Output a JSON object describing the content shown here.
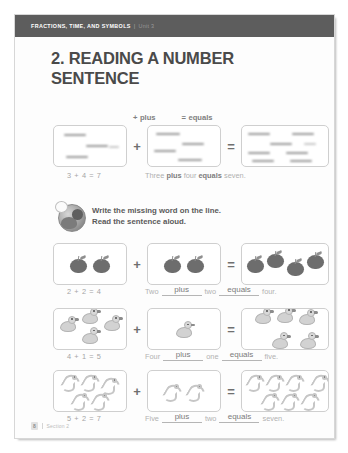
{
  "header": {
    "title": "FRACTIONS, TIME, AND SYMBOLS",
    "separator": "|",
    "unit": "Unit 3"
  },
  "lesson": {
    "title": "2. READING A NUMBER SENTENCE"
  },
  "symbol_key": [
    {
      "symbol": "+",
      "word": "plus"
    },
    {
      "symbol": "=",
      "word": "equals"
    }
  ],
  "example": {
    "operator_plus": "+",
    "operator_equals": "=",
    "equation": "3 + 4 = 7",
    "sentence_parts": {
      "first": "Three",
      "plus": "plus",
      "second": "four",
      "equals": "equals",
      "result": "seven."
    }
  },
  "instruction": {
    "icon": "teacher-badge-icon",
    "line1": "Write the missing word on the line.",
    "line2": "Read the sentence aloud."
  },
  "problems": [
    {
      "id": "apples",
      "item_icon": "apple-icon",
      "left_count": 2,
      "right_count": 2,
      "total_count": 4,
      "operator_plus": "+",
      "operator_equals": "=",
      "equation": "2 + 2 = 4",
      "sentence": {
        "first": "Two",
        "blank1": "plus",
        "second": "two",
        "blank2": "equals",
        "result": "four."
      }
    },
    {
      "id": "ducks",
      "item_icon": "duck-icon",
      "left_count": 4,
      "right_count": 1,
      "total_count": 5,
      "operator_plus": "+",
      "operator_equals": "=",
      "equation": "4 + 1 = 5",
      "sentence": {
        "first": "Four",
        "blank1": "plus",
        "second": "one",
        "blank2": "equals",
        "result": "five."
      }
    },
    {
      "id": "worms",
      "item_icon": "worm-icon",
      "left_count": 5,
      "right_count": 2,
      "total_count": 7,
      "operator_plus": "+",
      "operator_equals": "=",
      "equation": "5 + 2 = 7",
      "sentence": {
        "first": "Five",
        "blank1": "plus",
        "second": "two",
        "blank2": "equals",
        "result": "seven."
      }
    }
  ],
  "footer": {
    "page_number": "8",
    "section_label": "Section 2"
  },
  "colors": {
    "header_band": "#5d5d5d",
    "title_text": "#4a4a4a",
    "box_border": "#cfcfcf",
    "muted_text": "#a5a5a5",
    "item_dark": "#6d6d6d",
    "item_light": "#d2d2d2"
  }
}
